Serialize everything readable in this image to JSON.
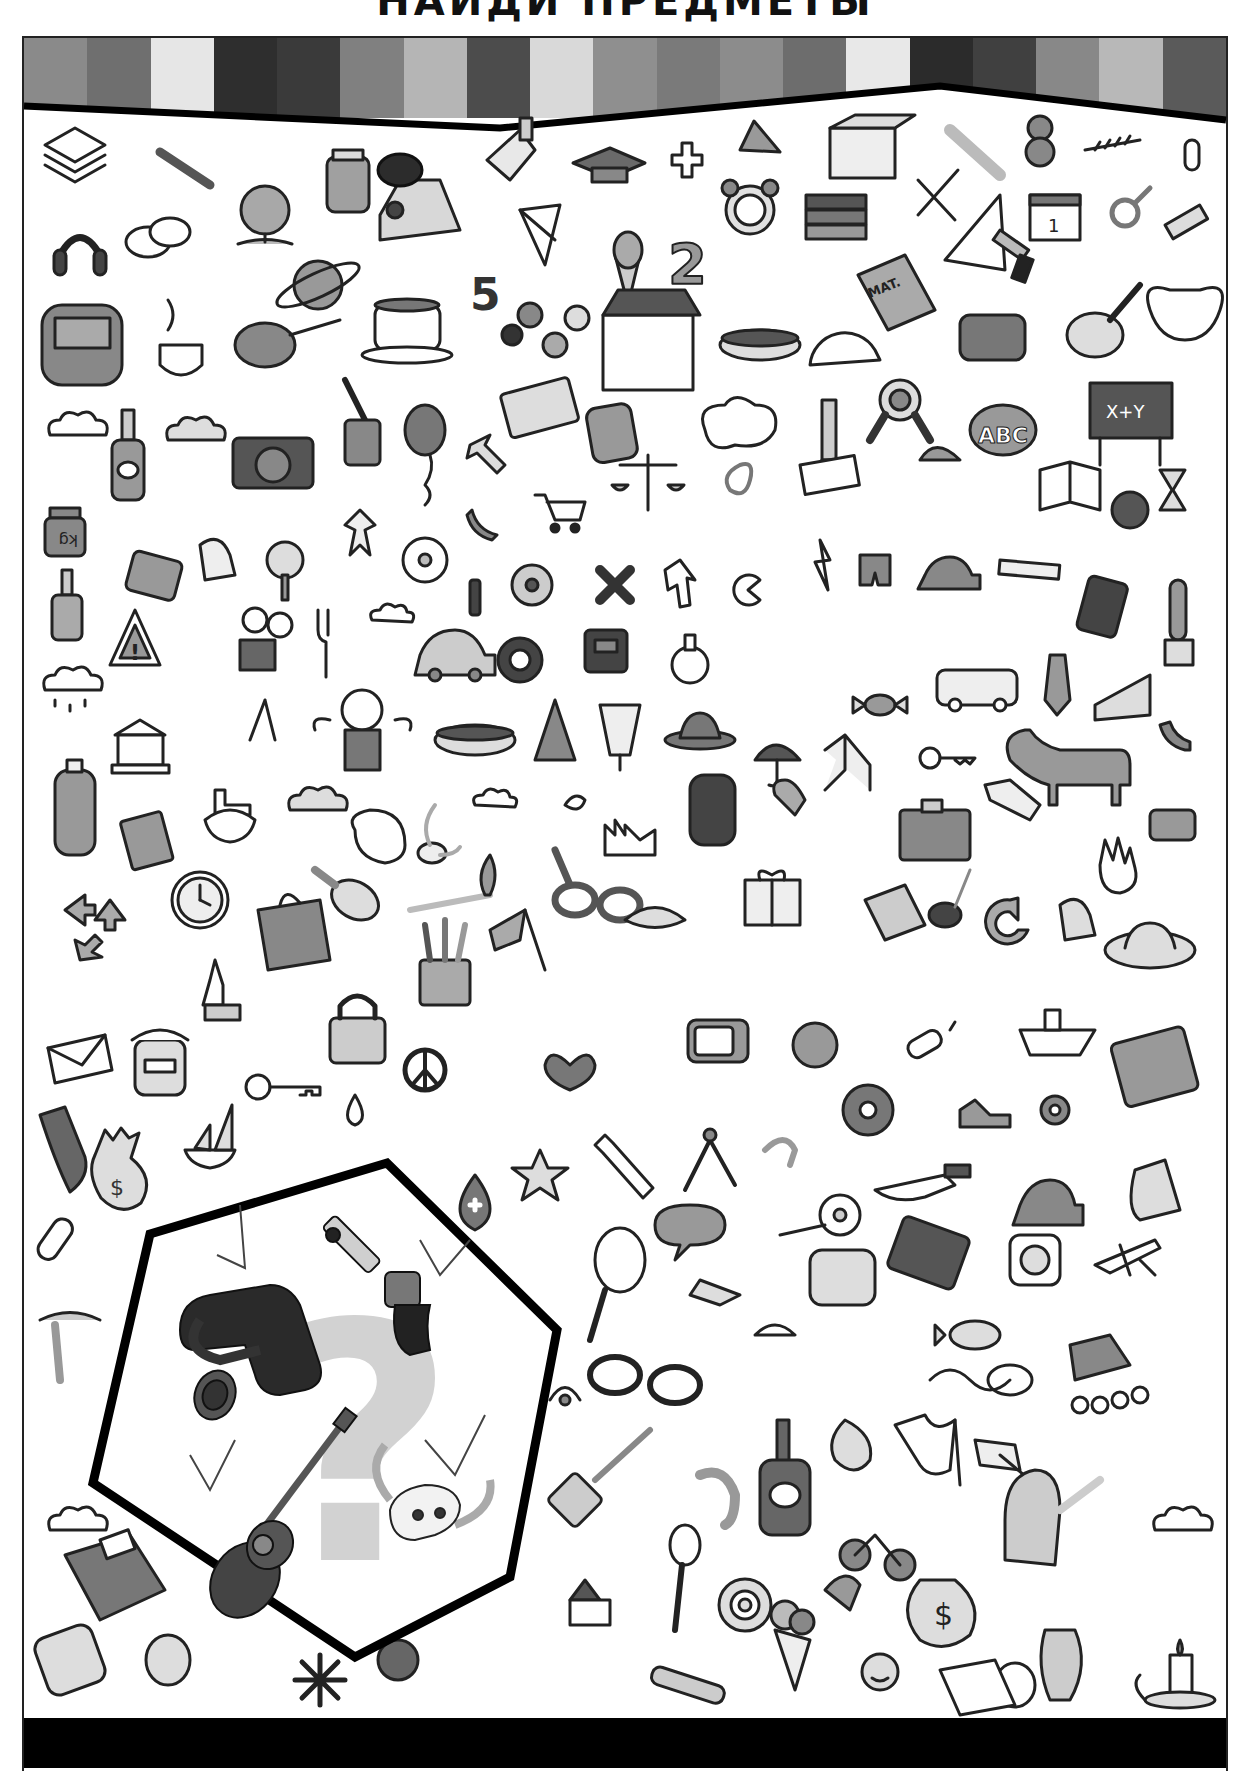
{
  "page": {
    "title_partial": "НАЙДИ ПРЕДМЕТЫ",
    "type": "hidden-object puzzle"
  },
  "header": {
    "stripe_colors": [
      "#8a8a8a",
      "#6f6f6f",
      "#e6e6e6",
      "#2e2e2e",
      "#3a3a3a",
      "#808080",
      "#b5b5b5",
      "#4c4c4c",
      "#d9d9d9",
      "#8f8f8f",
      "#7a7a7a",
      "#8c8c8c",
      "#6d6d6d",
      "#e8e8e8",
      "#2b2b2b",
      "#404040",
      "#888888",
      "#b8b8b8",
      "#5a5a5a"
    ]
  },
  "puzzle": {
    "panel_label": "?",
    "targets": [
      {
        "id": "holster",
        "label": "gun belt with holster",
        "found": true
      },
      {
        "id": "revolver",
        "label": "revolver",
        "found": true
      },
      {
        "id": "guitar",
        "label": "acoustic guitar",
        "found": true
      },
      {
        "id": "skull",
        "label": "bull skull with horns",
        "found": true
      }
    ],
    "checkmarks": 4
  },
  "scene_labels": {
    "math_book": "MAT.",
    "blackboard": "X+Y",
    "abc_block": "ABC",
    "weight": "kg",
    "number_five": "5",
    "number_two": "2",
    "money_bag": "$",
    "calendar": "1"
  },
  "scene_items": [
    "paper stack",
    "paintbrush",
    "globe",
    "jar",
    "sneaker",
    "hand bell",
    "graduation cap",
    "plus sign",
    "pyramid",
    "box",
    "carrot",
    "teddy bear",
    "fern",
    "paper clip",
    "headphones",
    "speech bubbles",
    "saturn",
    "paper plane",
    "ice cream cone",
    "alarm clock",
    "books",
    "fork and knife",
    "set square",
    "calendar",
    "male symbol",
    "paint tube",
    "backpack",
    "coffee cup",
    "tape measure",
    "teacup",
    "molecule",
    "school building",
    "hot dog",
    "protractor",
    "math book",
    "hole punch",
    "trumpet",
    "lyre",
    "cloud",
    "bottle",
    "camera",
    "spatula",
    "balloon",
    "id card",
    "calculator",
    "thought bubble",
    "pencil",
    "rosette",
    "abc block",
    "blackboard",
    "weight",
    "school bag",
    "bell",
    "tree",
    "gingerbread man",
    "flower",
    "shoe",
    "shopping cart",
    "scales",
    "pretzel",
    "scroll",
    "cap",
    "open book",
    "apple",
    "hourglass",
    "warning sign",
    "film camera",
    "fork",
    "car",
    "gear",
    "floppy disk",
    "flask",
    "sneaker",
    "bank building",
    "candy",
    "bus",
    "cake",
    "tie",
    "mobile phone",
    "cactus",
    "doll",
    "hot dog",
    "fir tree",
    "cocktail",
    "hat",
    "umbrella",
    "chair",
    "key",
    "dog",
    "shoe",
    "rubber",
    "briefcase",
    "paint palette",
    "match",
    "factory",
    "barrel",
    "recycle arrows",
    "clock",
    "shopping bag",
    "pencil cup",
    "flag",
    "glasses",
    "croissant",
    "gift",
    "book",
    "magnifier",
    "hand",
    "sun hat",
    "envelope",
    "jam jar",
    "key",
    "peace sign",
    "drop",
    "heart",
    "television",
    "earth",
    "candle",
    "ship",
    "notebook",
    "bomb",
    "money bag",
    "sailboat",
    "star",
    "wrench",
    "compass",
    "flower",
    "knife",
    "car",
    "roller skate",
    "tennis racket",
    "telephone",
    "socket",
    "airplane",
    "fish",
    "mouse",
    "eye",
    "spatula",
    "spoon",
    "snail shell",
    "bicycle",
    "flag",
    "watering can",
    "cloud",
    "house",
    "utility knife",
    "ice cream",
    "sun",
    "toilet paper",
    "vase",
    "candle holder",
    "telephone",
    "cookie",
    "snowflake",
    "orange",
    "zeppelin"
  ],
  "footer": {
    "bar_color": "#000000"
  }
}
